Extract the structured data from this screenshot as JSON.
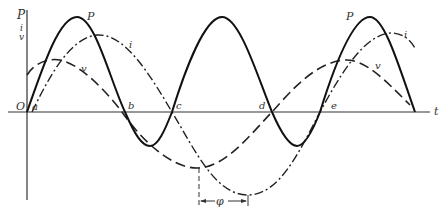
{
  "diagram": {
    "title": "",
    "axis_labels": {
      "y_top": "P",
      "y_mid": "i",
      "y_bot": "v",
      "x": "t",
      "origin": "O"
    },
    "curve_labels": {
      "P1": "P",
      "P2": "P",
      "i1": "i",
      "i2": "i",
      "v1": "v",
      "v2": "v"
    },
    "points": {
      "a": "a",
      "b": "b",
      "c": "c",
      "d": "d",
      "e": "e"
    },
    "phase_label": "φ",
    "colors": {
      "line": "#222222",
      "axis": "#333333",
      "background": "#ffffff"
    }
  }
}
